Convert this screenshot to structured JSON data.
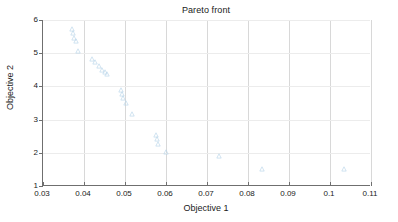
{
  "chart": {
    "title": "Pareto front",
    "xlabel": "Objective 1",
    "ylabel": "Objective 2"
  },
  "chart_data": {
    "type": "scatter",
    "title": "Pareto front",
    "xlabel": "Objective 1",
    "ylabel": "Objective 2",
    "xlim": [
      0.03,
      0.11
    ],
    "ylim": [
      1,
      6
    ],
    "xticks": [
      0.03,
      0.04,
      0.05,
      0.06,
      0.07,
      0.08,
      0.09,
      0.1,
      0.11
    ],
    "xticklabels": [
      "0.03",
      "0.04",
      "0.05",
      "0.06",
      "0.07",
      "0.08",
      "0.09",
      "0.1",
      "0.11"
    ],
    "yticks": [
      1,
      2,
      3,
      4,
      5,
      6
    ],
    "yticklabels": [
      "1",
      "2",
      "3",
      "4",
      "5",
      "6"
    ],
    "grid": true,
    "legend": null,
    "marker": "triangle",
    "marker_color": "#b9d5ea",
    "series": [
      {
        "name": "Pareto front",
        "points": [
          {
            "x": 0.037,
            "y": 5.72
          },
          {
            "x": 0.0373,
            "y": 5.6
          },
          {
            "x": 0.0376,
            "y": 5.46
          },
          {
            "x": 0.0381,
            "y": 5.36
          },
          {
            "x": 0.0386,
            "y": 5.06
          },
          {
            "x": 0.042,
            "y": 4.82
          },
          {
            "x": 0.0428,
            "y": 4.72
          },
          {
            "x": 0.0437,
            "y": 4.6
          },
          {
            "x": 0.0443,
            "y": 4.5
          },
          {
            "x": 0.045,
            "y": 4.42
          },
          {
            "x": 0.0455,
            "y": 4.36
          },
          {
            "x": 0.049,
            "y": 3.88
          },
          {
            "x": 0.0493,
            "y": 3.78
          },
          {
            "x": 0.0496,
            "y": 3.66
          },
          {
            "x": 0.0502,
            "y": 3.5
          },
          {
            "x": 0.0518,
            "y": 3.18
          },
          {
            "x": 0.0576,
            "y": 2.54
          },
          {
            "x": 0.0578,
            "y": 2.42
          },
          {
            "x": 0.058,
            "y": 2.28
          },
          {
            "x": 0.0601,
            "y": 2.02
          },
          {
            "x": 0.073,
            "y": 1.9
          },
          {
            "x": 0.0833,
            "y": 1.52
          },
          {
            "x": 0.1033,
            "y": 1.5
          }
        ]
      }
    ]
  }
}
